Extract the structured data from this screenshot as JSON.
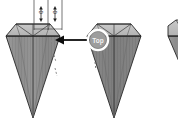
{
  "diagram": {
    "background_color": "#ffffff",
    "outline_color": "#262626",
    "crown_fill": "#bcbcbc",
    "crown_fill_light": "#cfcfcf",
    "pavilion_fill": "#8f8f8f",
    "pavilion_fill_dark": "#7a7a7a",
    "annotation_color": "#1a1a1a",
    "dashed_color": "#9a9a9a"
  },
  "callout": {
    "badge_label": "Top",
    "badge_ring_color": "#ffffff",
    "badge_fill_color": "#9d9d9d",
    "arrow_color": "#0d0d0d",
    "arrow_direction": "left"
  },
  "dimensions": [
    {
      "id": "dim-left",
      "label": "0",
      "orientation": "vertical"
    },
    {
      "id": "dim-right",
      "label": "0",
      "orientation": "vertical"
    }
  ],
  "shapes": [
    {
      "id": "gem-left",
      "name": "gemstone-left",
      "state": "annotated"
    },
    {
      "id": "gem-center",
      "name": "gemstone-center",
      "state": "callout-target"
    },
    {
      "id": "gem-right",
      "name": "gemstone-right-partial",
      "state": "clipped"
    }
  ]
}
